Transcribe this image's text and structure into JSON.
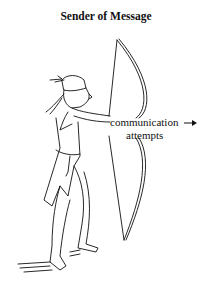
{
  "diagram": {
    "title": "Sender of Message",
    "label_line1": "communication",
    "label_line2": "attempts",
    "arrow": "right-arrow",
    "figure": "archer-drawing-bow",
    "ink_color": "#111111",
    "background": "#ffffff"
  }
}
